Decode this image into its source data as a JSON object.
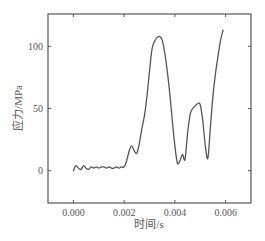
{
  "chart_data": {
    "type": "line",
    "title": "",
    "xlabel": "时间/s",
    "ylabel": "应力/MPa",
    "xlim": [
      -0.001,
      0.007
    ],
    "ylim": [
      -26,
      126
    ],
    "xticks": [
      0.0,
      0.002,
      0.004,
      0.006
    ],
    "xtick_labels": [
      "0.000",
      "0.002",
      "0.004",
      "0.006"
    ],
    "yticks": [
      0,
      50,
      100
    ],
    "ytick_labels": [
      "0",
      "50",
      "100"
    ],
    "grid": false,
    "legend": null,
    "series": [
      {
        "name": "stress",
        "color": "#555555",
        "x": [
          0.0,
          0.0001,
          0.0002,
          0.0003,
          0.0004,
          0.0005,
          0.0006,
          0.0007,
          0.0008,
          0.0009,
          0.001,
          0.0011,
          0.0012,
          0.0013,
          0.0014,
          0.0015,
          0.0016,
          0.0017,
          0.0018,
          0.0019,
          0.002,
          0.0021,
          0.0022,
          0.0023,
          0.0024,
          0.0025,
          0.0026,
          0.0027,
          0.0028,
          0.0029,
          0.003,
          0.0031,
          0.0032,
          0.0033,
          0.0034,
          0.0035,
          0.0036,
          0.0037,
          0.0038,
          0.0039,
          0.004,
          0.0041,
          0.0042,
          0.0043,
          0.0044,
          0.0045,
          0.0046,
          0.0047,
          0.0048,
          0.0049,
          0.005,
          0.0051,
          0.0052,
          0.0053,
          0.0054,
          0.0055,
          0.0056,
          0.0057,
          0.0058,
          0.0059
        ],
        "y": [
          0,
          4,
          2,
          1,
          4,
          2,
          1,
          3,
          2,
          3,
          2,
          3,
          3,
          2,
          3,
          2,
          2,
          3,
          2,
          3,
          3,
          8,
          16,
          20,
          16,
          14,
          22,
          34,
          44,
          60,
          80,
          98,
          104,
          107,
          108,
          105,
          95,
          80,
          62,
          40,
          20,
          6,
          8,
          13,
          9,
          30,
          45,
          50,
          52,
          54,
          53,
          40,
          20,
          10,
          35,
          60,
          78,
          92,
          105,
          113
        ]
      }
    ]
  },
  "axes": {
    "x_label": "时间/s",
    "y_label": "应力/MPa"
  }
}
